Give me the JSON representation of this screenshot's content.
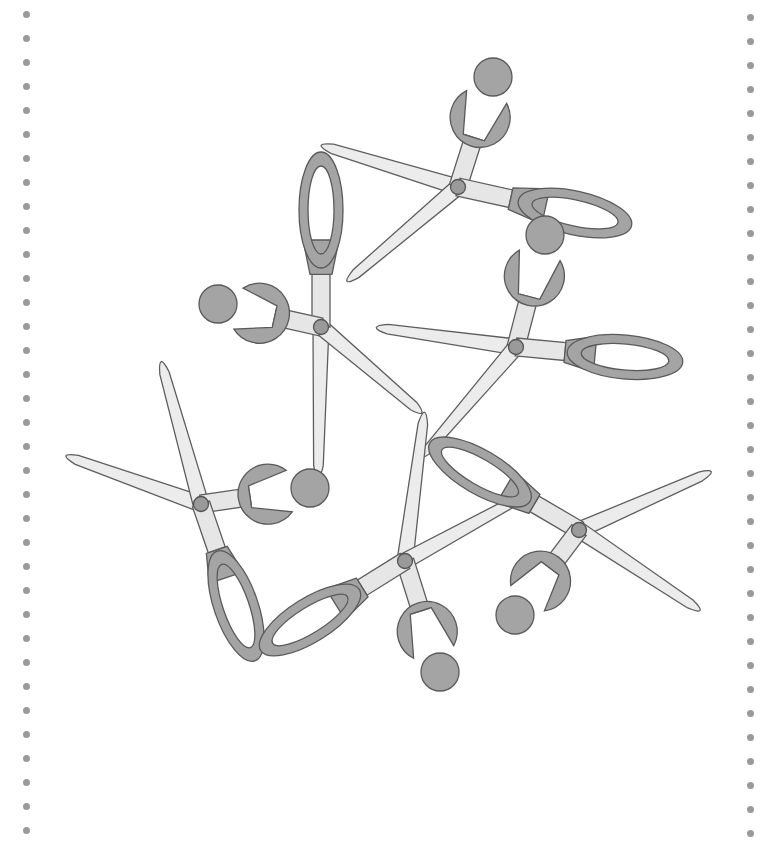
{
  "illustration": {
    "subject": "scattered scissors",
    "scissor_count": 8
  },
  "colors": {
    "background": "#ffffff",
    "handle": "#a4a4a4",
    "blade": "#ececec",
    "outline": "#5e5e5e",
    "margin_dot": "#9a9a9a"
  },
  "margins": {
    "left_dots": {
      "x": 26,
      "start_y": 14,
      "spacing": 24,
      "count": 35
    },
    "right_dots": {
      "x": 750,
      "start_y": 17,
      "spacing": 24,
      "count": 35
    }
  },
  "scissors": [
    {
      "id": "s1",
      "pivot": [
        458,
        187
      ],
      "handle_a": {
        "type": "ring",
        "center": [
          493,
          77
        ],
        "angle": -75
      },
      "handle_b": {
        "type": "loop",
        "center": [
          575,
          213
        ],
        "angle": 10
      },
      "blade_a_tip": [
        310,
        142
      ],
      "blade_b_tip": [
        338,
        289
      ]
    },
    {
      "id": "s2",
      "pivot": [
        321,
        327
      ],
      "handle_a": {
        "type": "loop",
        "center": [
          321,
          210
        ],
        "angle": -95
      },
      "handle_b": {
        "type": "ring",
        "center": [
          218,
          304
        ],
        "angle": 190
      },
      "blade_a_tip": [
        318,
        490
      ],
      "blade_b_tip": [
        430,
        420
      ]
    },
    {
      "id": "s3",
      "pivot": [
        516,
        347
      ],
      "handle_a": {
        "type": "ring",
        "center": [
          545,
          235
        ],
        "angle": -75
      },
      "handle_b": {
        "type": "loop",
        "center": [
          625,
          357
        ],
        "angle": 5
      },
      "blade_a_tip": [
        365,
        326
      ],
      "blade_b_tip": [
        414,
        466
      ]
    },
    {
      "id": "s4",
      "pivot": [
        201,
        504
      ],
      "handle_a": {
        "type": "ring",
        "center": [
          310,
          488
        ],
        "angle": -8
      },
      "handle_b": {
        "type": "loop",
        "center": [
          236,
          606
        ],
        "angle": 70
      },
      "blade_a_tip": [
        55,
        452
      ],
      "blade_b_tip": [
        158,
        350
      ]
    },
    {
      "id": "s5",
      "pivot": [
        405,
        561
      ],
      "handle_a": {
        "type": "ring",
        "center": [
          440,
          672
        ],
        "angle": 75
      },
      "handle_b": {
        "type": "loop",
        "center": [
          310,
          620
        ],
        "angle": 150
      },
      "blade_a_tip": [
        426,
        400
      ],
      "blade_b_tip": [
        540,
        487
      ]
    },
    {
      "id": "s6",
      "pivot": [
        579,
        530
      ],
      "handle_a": {
        "type": "loop",
        "center": [
          480,
          472
        ],
        "angle": 205
      },
      "handle_b": {
        "type": "ring",
        "center": [
          515,
          615
        ],
        "angle": 120
      },
      "blade_a_tip": [
        722,
        467
      ],
      "blade_b_tip": [
        710,
        617
      ]
    }
  ]
}
